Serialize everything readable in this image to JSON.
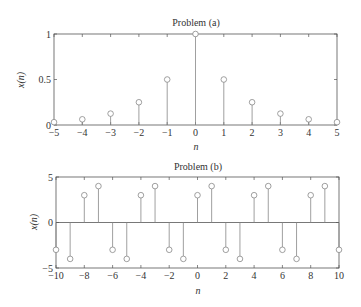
{
  "chart_data": [
    {
      "type": "stem",
      "title": "Problem (a)",
      "xlabel": "n",
      "ylabel": "x(n)",
      "xlim": [
        -5,
        5
      ],
      "ylim": [
        0,
        1
      ],
      "xticks": [
        "-5",
        "-4",
        "-3",
        "-2",
        "-1",
        "0",
        "1",
        "2",
        "3",
        "4",
        "5"
      ],
      "yticks": [
        "0",
        "0.5",
        "1"
      ],
      "x": [
        -5,
        -4,
        -3,
        -2,
        -1,
        0,
        1,
        2,
        3,
        4,
        5
      ],
      "values": [
        0.03125,
        0.0625,
        0.125,
        0.25,
        0.5,
        1,
        0.5,
        0.25,
        0.125,
        0.0625,
        0.03125
      ],
      "grid": false
    },
    {
      "type": "stem",
      "title": "Problem (b)",
      "xlabel": "n",
      "ylabel": "x(n)",
      "xlim": [
        -10,
        10
      ],
      "ylim": [
        -5,
        5
      ],
      "xticks": [
        "-10",
        "-8",
        "-6",
        "-4",
        "-2",
        "0",
        "2",
        "4",
        "6",
        "8",
        "10"
      ],
      "yticks": [
        "-5",
        "0",
        "5"
      ],
      "x": [
        -10,
        -9,
        -8,
        -7,
        -6,
        -5,
        -4,
        -3,
        -2,
        -1,
        0,
        1,
        2,
        3,
        4,
        5,
        6,
        7,
        8,
        9,
        10
      ],
      "values": [
        -3,
        -4,
        3,
        4,
        -3,
        -4,
        3,
        4,
        -3,
        -4,
        3,
        4,
        -3,
        -4,
        3,
        4,
        -3,
        -4,
        3,
        4,
        -3
      ],
      "grid": false
    }
  ],
  "plots": [
    {
      "title": "Problem (a)",
      "xlabel": "n",
      "ylabel": "x(n)"
    },
    {
      "title": "Problem (b)",
      "xlabel": "n",
      "ylabel": "x(n)"
    }
  ],
  "colors": {
    "stem": "#888888",
    "axis": "#555555",
    "text": "#333333"
  }
}
